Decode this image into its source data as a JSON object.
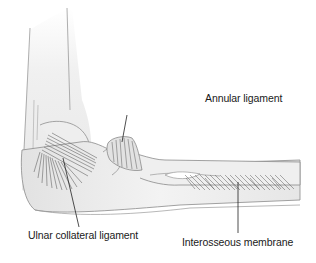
{
  "figure": {
    "labels": {
      "annular": "Annular ligament",
      "ulnar_collateral": "Ulnar collateral ligament",
      "interosseous": "Interosseous membrane"
    },
    "colors": {
      "bone_fill": "#ececec",
      "bone_outline": "#8a8a8a",
      "ligament_stroke": "#555555",
      "leader_line": "#222222",
      "text": "#1a1a1a",
      "background": "#ffffff"
    }
  }
}
